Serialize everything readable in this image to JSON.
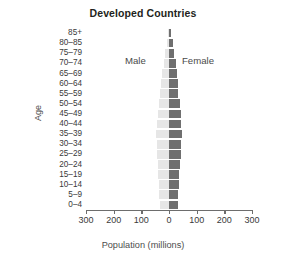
{
  "chart_data": {
    "type": "bar",
    "subtype": "population-pyramid",
    "title": "Developed Countries",
    "xlabel": "Population (millions)",
    "ylabel": "Age",
    "orientation": "horizontal",
    "grid": false,
    "legend_position": "inside-top",
    "xlim": [
      -300,
      300
    ],
    "xticks": [
      -300,
      -200,
      -100,
      0,
      100,
      200,
      300
    ],
    "xtick_labels": [
      "300",
      "200",
      "100",
      "0",
      "100",
      "200",
      "300"
    ],
    "categories": [
      "85+",
      "80–85",
      "75–79",
      "70–74",
      "65–69",
      "60–64",
      "55–59",
      "50–54",
      "45–49",
      "40–44",
      "35–39",
      "30–34",
      "25–29",
      "20–24",
      "15–19",
      "10–14",
      "5–9",
      "0–4"
    ],
    "series": [
      {
        "name": "Male",
        "side": "left",
        "color": "#e6e6e6",
        "values": [
          5,
          9,
          14,
          19,
          24,
          28,
          32,
          36,
          41,
          44,
          47,
          45,
          42,
          40,
          38,
          37,
          35,
          34
        ]
      },
      {
        "name": "Female",
        "side": "right",
        "color": "#6f6f6f",
        "values": [
          9,
          14,
          19,
          24,
          28,
          31,
          34,
          38,
          42,
          45,
          47,
          45,
          42,
          40,
          37,
          36,
          34,
          33
        ]
      }
    ]
  },
  "colors": {
    "male": "#e6e6e6",
    "female": "#6f6f6f",
    "axis": "#6d6d6d",
    "text": "#231f20",
    "background": "#ffffff"
  }
}
